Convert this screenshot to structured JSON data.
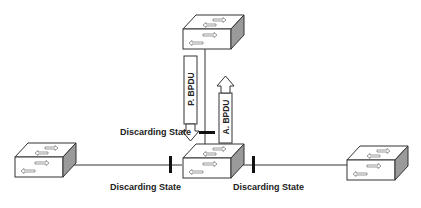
{
  "diagram": {
    "type": "network-topology",
    "colors": {
      "line": "#333333",
      "switch_face": "#ffffff",
      "switch_side": "#9a9a9a",
      "port_marker": "#111111"
    },
    "switches": [
      {
        "id": "top",
        "label": "",
        "icon": "switch-icon"
      },
      {
        "id": "left",
        "label": "",
        "icon": "switch-icon"
      },
      {
        "id": "center",
        "label": "",
        "icon": "switch-icon"
      },
      {
        "id": "right",
        "label": "",
        "icon": "switch-icon"
      }
    ],
    "messages": {
      "proposal": "P. BPDU",
      "agreement": "A. BPDU"
    },
    "port_states": {
      "top_link": "Discarding State",
      "left_link": "Discarding State",
      "right_link": "Discarding State"
    }
  }
}
